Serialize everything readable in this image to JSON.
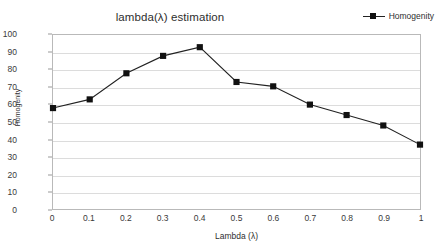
{
  "chart_data": {
    "type": "line",
    "title": "lambda(λ) estimation",
    "xlabel": "Lambda (λ)",
    "ylabel": "Homogenity",
    "x": [
      0,
      0.1,
      0.2,
      0.3,
      0.4,
      0.5,
      0.6,
      0.7,
      0.8,
      0.9,
      1
    ],
    "xtick_labels": [
      "0",
      "0.1",
      "0.2",
      "0.3",
      "0.4",
      "0.5",
      "0.6",
      "0.7",
      "0.8",
      "0.9",
      "1"
    ],
    "ytick_labels": [
      "100",
      "90",
      "80",
      "70",
      "60",
      "50",
      "40",
      "30",
      "20",
      "10",
      "0"
    ],
    "yticks": [
      100,
      90,
      80,
      70,
      60,
      50,
      40,
      30,
      20,
      10,
      0
    ],
    "xlim": [
      0,
      1
    ],
    "ylim": [
      0,
      100
    ],
    "grid": "horizontal",
    "legend_position": "top-right",
    "marker": "square",
    "line_color": "#222222",
    "marker_color": "#111111",
    "grid_color": "#dcdcdc",
    "series": [
      {
        "name": "Homogenity",
        "values": [
          58,
          63,
          78,
          88,
          93,
          73,
          70.5,
          60,
          54,
          48,
          37
        ]
      }
    ]
  },
  "legend": {
    "entries": [
      {
        "label": "Homogenity"
      }
    ]
  }
}
